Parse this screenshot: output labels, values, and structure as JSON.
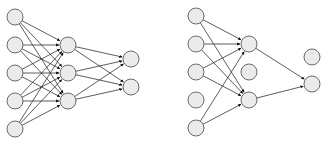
{
  "title": "",
  "colors": {
    "node_fill": "#ebebeb",
    "node_stroke": "#6b6b6b",
    "edge": "#333333",
    "background": "#ffffff"
  },
  "networks": [
    {
      "name": "standard-network",
      "node_radius": 8,
      "layers": [
        {
          "name": "input",
          "nodes": [
            [
              15,
              17
            ],
            [
              15,
              45
            ],
            [
              15,
              73
            ],
            [
              15,
              101
            ],
            [
              15,
              129
            ]
          ]
        },
        {
          "name": "hidden",
          "nodes": [
            [
              68,
              45
            ],
            [
              68,
              73
            ],
            [
              68,
              101
            ]
          ]
        },
        {
          "name": "output",
          "nodes": [
            [
              131,
              59
            ],
            [
              131,
              87
            ]
          ]
        }
      ],
      "edges": [
        [
          0,
          0,
          1,
          0
        ],
        [
          0,
          0,
          1,
          1
        ],
        [
          0,
          0,
          1,
          2
        ],
        [
          0,
          1,
          1,
          0
        ],
        [
          0,
          1,
          1,
          1
        ],
        [
          0,
          1,
          1,
          2
        ],
        [
          0,
          2,
          1,
          0
        ],
        [
          0,
          2,
          1,
          1
        ],
        [
          0,
          2,
          1,
          2
        ],
        [
          0,
          3,
          1,
          0
        ],
        [
          0,
          3,
          1,
          1
        ],
        [
          0,
          3,
          1,
          2
        ],
        [
          0,
          4,
          1,
          0
        ],
        [
          0,
          4,
          1,
          1
        ],
        [
          0,
          4,
          1,
          2
        ],
        [
          1,
          0,
          2,
          0
        ],
        [
          1,
          0,
          2,
          1
        ],
        [
          1,
          1,
          2,
          0
        ],
        [
          1,
          1,
          2,
          1
        ],
        [
          1,
          2,
          2,
          0
        ],
        [
          1,
          2,
          2,
          1
        ]
      ]
    },
    {
      "name": "dropout-network",
      "node_radius": 8,
      "layers": [
        {
          "name": "input",
          "nodes": [
            [
              196,
              16
            ],
            [
              196,
              44
            ],
            [
              196,
              72
            ],
            [
              196,
              100
            ],
            [
              196,
              128
            ]
          ]
        },
        {
          "name": "hidden",
          "nodes": [
            [
              249,
              44
            ],
            [
              249,
              72
            ],
            [
              249,
              100
            ]
          ]
        },
        {
          "name": "output",
          "nodes": [
            [
              312,
              57
            ],
            [
              312,
              84
            ]
          ]
        }
      ],
      "edges": [
        [
          0,
          0,
          1,
          0
        ],
        [
          0,
          0,
          1,
          2
        ],
        [
          0,
          1,
          1,
          0
        ],
        [
          0,
          1,
          1,
          2
        ],
        [
          0,
          2,
          1,
          0
        ],
        [
          0,
          2,
          1,
          2
        ],
        [
          0,
          4,
          1,
          0
        ],
        [
          0,
          4,
          1,
          2
        ],
        [
          1,
          0,
          2,
          1
        ],
        [
          1,
          2,
          2,
          1
        ]
      ]
    }
  ]
}
